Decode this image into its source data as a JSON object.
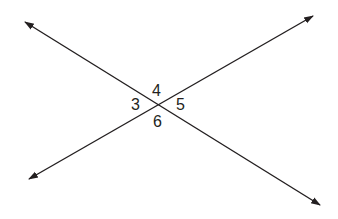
{
  "diagram": {
    "line_color": "#231f20",
    "intersection": [
      157,
      103
    ],
    "lines": [
      {
        "from": [
          25,
          22
        ],
        "to": [
          320,
          205
        ]
      },
      {
        "from": [
          29,
          179
        ],
        "to": [
          313,
          16
        ]
      }
    ],
    "angle_labels": [
      {
        "label": "4",
        "position": "top"
      },
      {
        "label": "3",
        "position": "left"
      },
      {
        "label": "5",
        "position": "right"
      },
      {
        "label": "6",
        "position": "bottom"
      }
    ]
  }
}
